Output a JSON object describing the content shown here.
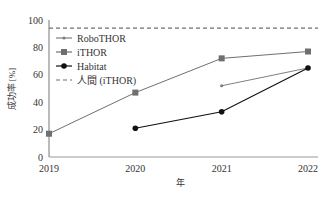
{
  "chart_data": {
    "type": "line",
    "title": "",
    "xlabel": "年",
    "ylabel": "成功率 [%]",
    "x": [
      2019,
      2020,
      2021,
      2022
    ],
    "xticks": [
      "2019",
      "2020",
      "2021",
      "2022"
    ],
    "yticks": [
      "0",
      "20",
      "40",
      "60",
      "80",
      "100"
    ],
    "ylim": [
      0,
      100
    ],
    "grid": false,
    "legend_position": "upper-left",
    "series": [
      {
        "name": "RoboTHOR",
        "values": [
          null,
          null,
          52,
          65
        ],
        "color": "#7f7f7f",
        "marker": "small-dot"
      },
      {
        "name": "iTHOR",
        "values": [
          17,
          47,
          72,
          77
        ],
        "color": "#6f6f6f",
        "marker": "square"
      },
      {
        "name": "Habitat",
        "values": [
          null,
          21,
          33,
          65
        ],
        "color": "#111111",
        "marker": "circle"
      },
      {
        "name": "人間 (iTHOR)",
        "values": [
          94,
          94,
          94,
          94
        ],
        "color": "#6f6f6f",
        "style": "dashed"
      }
    ]
  }
}
